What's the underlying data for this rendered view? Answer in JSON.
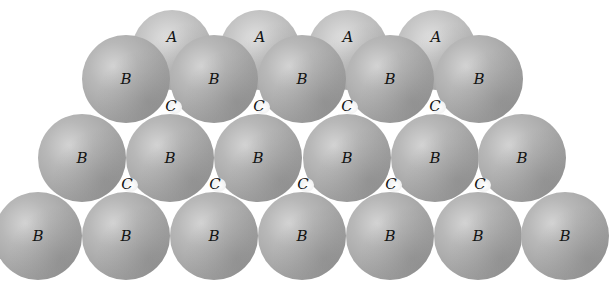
{
  "diagram": {
    "colors": {
      "background": "#ffffff",
      "sphere_a": "#c9c9c9",
      "sphere_b": "#a8a8a8",
      "label": "#141414"
    },
    "layers": [
      {
        "name": "A",
        "label": "A",
        "radius": 40,
        "spheres": [
          {
            "x": 172,
            "y": 50
          },
          {
            "x": 260,
            "y": 50
          },
          {
            "x": 348,
            "y": 50
          },
          {
            "x": 436,
            "y": 50
          }
        ],
        "label_offset_y": -13
      },
      {
        "name": "B-row-1",
        "label": "B",
        "radius": 44,
        "spheres": [
          {
            "x": 126,
            "y": 79
          },
          {
            "x": 214,
            "y": 79
          },
          {
            "x": 302,
            "y": 79
          },
          {
            "x": 390,
            "y": 79
          },
          {
            "x": 479,
            "y": 79
          }
        ],
        "label_offset_y": 0
      },
      {
        "name": "B-row-2",
        "label": "B",
        "radius": 44,
        "spheres": [
          {
            "x": 82,
            "y": 158
          },
          {
            "x": 170,
            "y": 158
          },
          {
            "x": 258,
            "y": 158
          },
          {
            "x": 347,
            "y": 158
          },
          {
            "x": 435,
            "y": 158
          },
          {
            "x": 522,
            "y": 158
          }
        ],
        "label_offset_y": 0
      },
      {
        "name": "B-row-3",
        "label": "B",
        "radius": 44,
        "spheres": [
          {
            "x": 38,
            "y": 236
          },
          {
            "x": 126,
            "y": 236
          },
          {
            "x": 214,
            "y": 236
          },
          {
            "x": 302,
            "y": 236
          },
          {
            "x": 390,
            "y": 236
          },
          {
            "x": 478,
            "y": 236
          },
          {
            "x": 565,
            "y": 236
          }
        ],
        "label_offset_y": 0
      }
    ],
    "c_sites": {
      "label": "C",
      "points": [
        {
          "x": 171,
          "y": 106
        },
        {
          "x": 259,
          "y": 106
        },
        {
          "x": 347,
          "y": 106
        },
        {
          "x": 435,
          "y": 106
        },
        {
          "x": 127,
          "y": 184
        },
        {
          "x": 215,
          "y": 184
        },
        {
          "x": 303,
          "y": 184
        },
        {
          "x": 391,
          "y": 184
        },
        {
          "x": 480,
          "y": 184
        }
      ]
    }
  }
}
